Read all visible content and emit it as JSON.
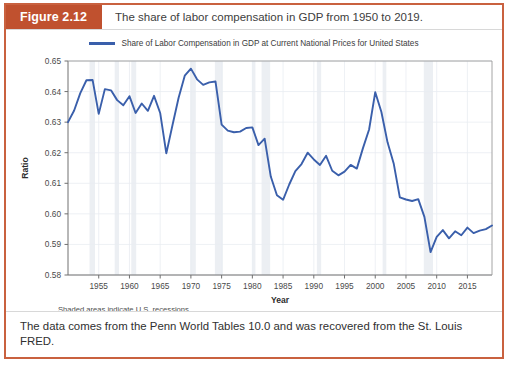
{
  "figure": {
    "badge": "Figure 2.12",
    "caption": "The share of labor compensation in GDP from 1950 to 2019.",
    "footer_text": "The data comes from the Penn World Tables 10.0 and was recovered from the St. Louis FRED.",
    "recession_note": "Shaded areas indicate U.S. recessions.",
    "badge_color": "#c0512f",
    "border_color": "#c9613f"
  },
  "chart_data": {
    "type": "line",
    "title": "",
    "xlabel": "Year",
    "ylabel": "Ratio",
    "xlim": [
      1950,
      2019
    ],
    "ylim": [
      0.58,
      0.65
    ],
    "xticks": [
      1955,
      1960,
      1965,
      1970,
      1975,
      1980,
      1985,
      1990,
      1995,
      2000,
      2005,
      2010,
      2015
    ],
    "yticks": [
      0.58,
      0.59,
      0.6,
      0.61,
      0.62,
      0.63,
      0.64,
      0.65
    ],
    "ytick_labels": [
      "0.58",
      "0.59",
      "0.60",
      "0.61",
      "0.62",
      "0.63",
      "0.64",
      "0.65"
    ],
    "grid": true,
    "legend_position": "top-center",
    "line_color": "#3a5fab",
    "recession_band_color": "#eceff3",
    "series": [
      {
        "name": "Share of Labor Compensation in GDP at Current National Prices for United States",
        "x": [
          1950,
          1951,
          1952,
          1953,
          1954,
          1955,
          1956,
          1957,
          1958,
          1959,
          1960,
          1961,
          1962,
          1963,
          1964,
          1965,
          1966,
          1967,
          1968,
          1969,
          1970,
          1971,
          1972,
          1973,
          1974,
          1975,
          1976,
          1977,
          1978,
          1979,
          1980,
          1981,
          1982,
          1983,
          1984,
          1985,
          1986,
          1987,
          1988,
          1989,
          1990,
          1991,
          1992,
          1993,
          1994,
          1995,
          1996,
          1997,
          1998,
          1999,
          2000,
          2001,
          2002,
          2003,
          2004,
          2005,
          2006,
          2007,
          2008,
          2009,
          2010,
          2011,
          2012,
          2013,
          2014,
          2015,
          2016,
          2017,
          2018,
          2019
        ],
        "values": [
          0.63,
          0.6338,
          0.6395,
          0.6437,
          0.6438,
          0.6327,
          0.6408,
          0.6404,
          0.6372,
          0.6355,
          0.6385,
          0.633,
          0.6361,
          0.6337,
          0.6386,
          0.633,
          0.6198,
          0.629,
          0.638,
          0.6452,
          0.6475,
          0.644,
          0.6422,
          0.643,
          0.6433,
          0.6292,
          0.6272,
          0.6267,
          0.6269,
          0.6281,
          0.6283,
          0.6225,
          0.6246,
          0.6122,
          0.6061,
          0.6046,
          0.6096,
          0.614,
          0.6163,
          0.62,
          0.6178,
          0.616,
          0.619,
          0.6141,
          0.6126,
          0.6138,
          0.616,
          0.6148,
          0.6215,
          0.6276,
          0.6398,
          0.6333,
          0.6234,
          0.6165,
          0.6054,
          0.6047,
          0.6042,
          0.6048,
          0.599,
          0.5875,
          0.5925,
          0.5947,
          0.592,
          0.5943,
          0.593,
          0.5955,
          0.5937,
          0.5945,
          0.595,
          0.5962
        ]
      }
    ],
    "recessions": [
      {
        "start": 1953.5,
        "end": 1954.4
      },
      {
        "start": 1957.6,
        "end": 1958.3
      },
      {
        "start": 1960.3,
        "end": 1961.1
      },
      {
        "start": 1969.9,
        "end": 1970.8
      },
      {
        "start": 1973.9,
        "end": 1975.2
      },
      {
        "start": 1980.0,
        "end": 1980.5
      },
      {
        "start": 1981.5,
        "end": 1982.9
      },
      {
        "start": 1990.5,
        "end": 1991.2
      },
      {
        "start": 2001.2,
        "end": 2001.8
      },
      {
        "start": 2007.9,
        "end": 2009.4
      }
    ]
  }
}
